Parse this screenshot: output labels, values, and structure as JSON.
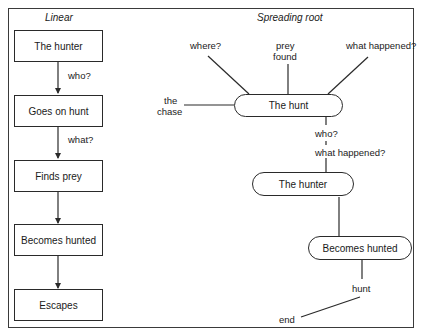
{
  "panels": {
    "linear": {
      "title": "Linear",
      "nodes": [
        {
          "label": "The hunter"
        },
        {
          "label": "Goes on hunt"
        },
        {
          "label": "Finds prey"
        },
        {
          "label": "Becomes hunted"
        },
        {
          "label": "Escapes"
        }
      ],
      "edges": [
        {
          "label": "who?"
        },
        {
          "label": "what?"
        },
        {
          "label": ""
        },
        {
          "label": ""
        }
      ]
    },
    "spreading": {
      "title": "Spreading root",
      "root": {
        "label": "The hunt"
      },
      "branches": {
        "where": "where?",
        "prey_found_1": "prey",
        "prey_found_2": "found",
        "what_happened_top": "what happened?",
        "the_chase_1": "the",
        "the_chase_2": "chase"
      },
      "connector_labels": {
        "who": "who?",
        "what_happened": "what happened?"
      },
      "hunter": {
        "label": "The hunter"
      },
      "becomes_hunted": {
        "label": "Becomes hunted"
      },
      "hunt": "hunt",
      "end": "end"
    }
  },
  "colors": {
    "line": "#2a2a2a",
    "background": "#ffffff"
  }
}
